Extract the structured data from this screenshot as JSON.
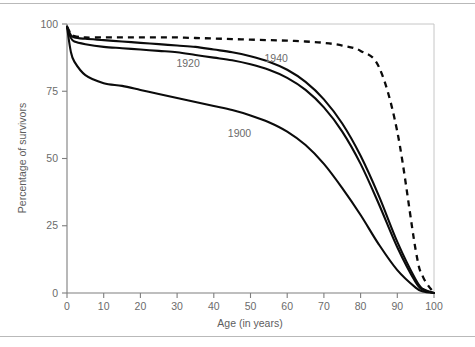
{
  "figure": {
    "background_color": "#ffffff",
    "ink_color": "#0b0b0b",
    "axis_color": "#7e7e7e",
    "text_color": "#6b6b6b"
  },
  "chart_data": {
    "type": "line",
    "title": "",
    "subtitle": "",
    "xlabel": "Age (in years)",
    "ylabel": "Percentage of survivors",
    "xlim": [
      0,
      100
    ],
    "ylim": [
      0,
      100
    ],
    "xticks": [
      0,
      10,
      20,
      30,
      40,
      50,
      60,
      70,
      80,
      90,
      100
    ],
    "yticks": [
      0,
      25,
      50,
      75,
      100
    ],
    "xtick_labels": [
      "0",
      "10",
      "20",
      "30",
      "40",
      "50",
      "60",
      "70",
      "80",
      "90",
      "100"
    ],
    "ytick_labels": [
      "0",
      "25",
      "50",
      "75",
      "100"
    ],
    "grid": false,
    "legend": "inline-curve-labels",
    "x": [
      0,
      1,
      2,
      5,
      10,
      15,
      20,
      25,
      30,
      35,
      40,
      45,
      50,
      55,
      60,
      65,
      70,
      75,
      80,
      85,
      90,
      95,
      97,
      100
    ],
    "series": [
      {
        "name": "1900",
        "label": "1900",
        "style": "solid",
        "label_x": 47,
        "label_y": 58,
        "values": [
          99,
          90,
          86,
          81,
          78,
          77,
          75.5,
          74,
          72.5,
          71,
          69.5,
          68,
          66,
          63.5,
          60,
          55,
          48,
          39,
          29,
          18,
          8.5,
          2,
          0.6,
          0
        ]
      },
      {
        "name": "1920",
        "label": "1920",
        "style": "solid",
        "label_x": 33,
        "label_y": 84,
        "values": [
          99,
          95,
          93.5,
          92.5,
          91.5,
          91,
          90.5,
          90,
          89.5,
          88.5,
          87.5,
          86.5,
          85,
          83,
          80,
          75.5,
          69,
          60,
          48,
          33,
          17,
          4,
          1.2,
          0
        ]
      },
      {
        "name": "1940",
        "label": "1940",
        "style": "solid",
        "label_x": 57,
        "label_y": 86,
        "values": [
          99,
          96,
          95,
          94.5,
          94,
          93.5,
          93,
          92.5,
          92,
          91.5,
          90.5,
          89.5,
          88,
          86,
          83,
          78.5,
          72,
          63,
          51,
          36,
          19,
          5,
          1.5,
          0
        ]
      },
      {
        "name": "ideal",
        "label": "",
        "style": "dashed",
        "label_x": null,
        "label_y": null,
        "values": [
          99,
          96.5,
          95.5,
          95,
          95,
          95,
          95,
          95,
          95,
          94.8,
          94.6,
          94.4,
          94.2,
          94,
          93.8,
          93.5,
          93,
          92,
          90,
          84,
          60,
          16,
          6,
          0
        ]
      }
    ],
    "annotations": [
      {
        "text": "1900",
        "x": 47,
        "y": 58
      },
      {
        "text": "1920",
        "x": 33,
        "y": 84
      },
      {
        "text": "1940",
        "x": 57,
        "y": 86
      }
    ]
  }
}
